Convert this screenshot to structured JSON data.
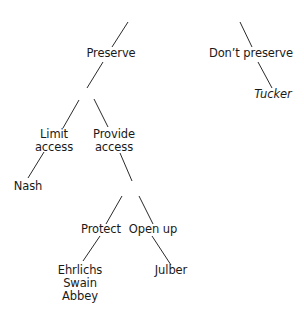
{
  "tree": {
    "nodes": {
      "preserve": "Preserve",
      "dont_preserve": "Don’t preserve",
      "tucker": "Tucker",
      "limit_access_1": "Limit",
      "limit_access_2": "access",
      "provide_access_1": "Provide",
      "provide_access_2": "access",
      "nash": "Nash",
      "protect": "Protect",
      "open_up": "Open up",
      "ehrlichs": "Ehrlichs",
      "swain": "Swain",
      "abbey": "Abbey",
      "julber": "Julber"
    },
    "structure": {
      "Preserve": {
        "Limit access": [
          "Nash"
        ],
        "Provide access": {
          "Protect": [
            "Ehrlichs",
            "Swain",
            "Abbey"
          ],
          "Open up": [
            "Julber"
          ]
        }
      },
      "Don't preserve": [
        "Tucker"
      ]
    }
  }
}
